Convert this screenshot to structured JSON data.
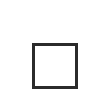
{
  "control": {
    "icon": "maximize-icon",
    "stroke_color": "#2b2b2b",
    "fill_color": "#ffffff"
  }
}
